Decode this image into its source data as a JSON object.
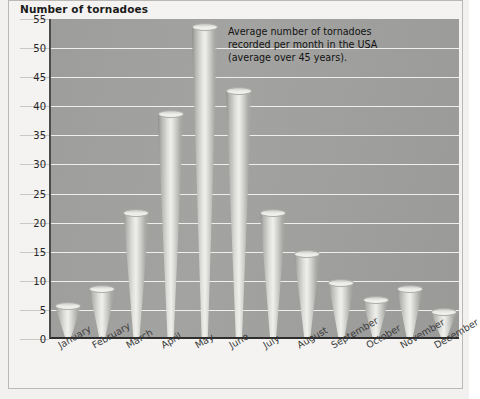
{
  "chart": {
    "title": "Number of tornadoes",
    "annotation_lines": [
      "Average number of tornadoes",
      "recorded per month in the USA",
      "(average over 45 years)."
    ]
  },
  "chart_data": {
    "type": "bar",
    "title": "Number of tornadoes",
    "xlabel": "",
    "ylabel": "Number of tornadoes",
    "ylim": [
      0,
      55
    ],
    "ytick_values": [
      0,
      5,
      10,
      15,
      20,
      25,
      30,
      35,
      40,
      45,
      50,
      55
    ],
    "grid": true,
    "legend": "none",
    "annotation": "Average number of tornadoes recorded per month in the USA (average over 45 years).",
    "categories": [
      "January",
      "February",
      "March",
      "April",
      "May",
      "June",
      "July",
      "August",
      "September",
      "October",
      "November",
      "December"
    ],
    "values": [
      6,
      9,
      22,
      39,
      54,
      43,
      22,
      15,
      10,
      7,
      9,
      5
    ],
    "bar_style": "cone",
    "plot_background": "#a0a09e",
    "gridline_color": "#efeeec"
  }
}
